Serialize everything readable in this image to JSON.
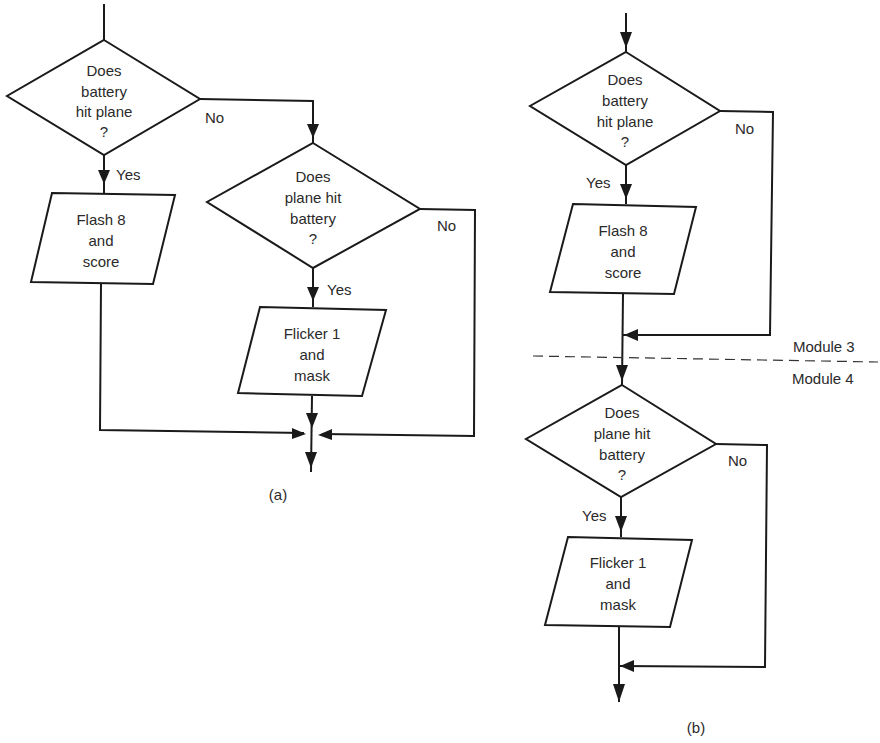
{
  "diagram_a": {
    "caption": "(a)",
    "decision1": {
      "lines": [
        "Does",
        "battery",
        "hit plane",
        "?"
      ],
      "yes_label": "Yes",
      "no_label": "No"
    },
    "process1": {
      "lines": [
        "Flash 8",
        "and",
        "score"
      ]
    },
    "decision2": {
      "lines": [
        "Does",
        "plane hit",
        "battery",
        "?"
      ],
      "yes_label": "Yes",
      "no_label": "No"
    },
    "process2": {
      "lines": [
        "Flicker 1",
        "and",
        "mask"
      ]
    }
  },
  "diagram_b": {
    "caption": "(b)",
    "decision1": {
      "lines": [
        "Does",
        "battery",
        "hit plane",
        "?"
      ],
      "yes_label": "Yes",
      "no_label": "No"
    },
    "process1": {
      "lines": [
        "Flash 8",
        "and",
        "score"
      ]
    },
    "module_above": "Module 3",
    "module_below": "Module 4",
    "decision2": {
      "lines": [
        "Does",
        "plane hit",
        "battery",
        "?"
      ],
      "yes_label": "Yes",
      "no_label": "No"
    },
    "process2": {
      "lines": [
        "Flicker 1",
        "and",
        "mask"
      ]
    }
  }
}
